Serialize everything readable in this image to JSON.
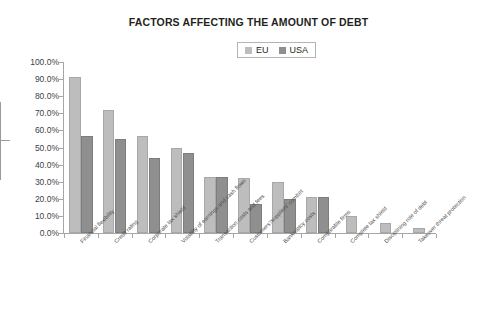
{
  "chart_data": {
    "type": "bar",
    "title": "FACTORS AFFECTING THE AMOUNT OF DEBT",
    "xlabel": "",
    "ylabel": "",
    "ylim": [
      0,
      100
    ],
    "ytick_labels": [
      "100.0%",
      "90.0%",
      "80.0%",
      "70.0%",
      "60.0%",
      "50.0%",
      "40.0%",
      "30.0%",
      "20.0%",
      "10.0%",
      "0.0%"
    ],
    "ytick_values": [
      100,
      90,
      80,
      70,
      60,
      50,
      40,
      30,
      20,
      10,
      0
    ],
    "grid": false,
    "legend_position": "top-center",
    "categories": [
      "Financial flexibility",
      "Credit rating",
      "Corporate tax shield",
      "Volatility of earnings and cash flows",
      "Transaction costs and fees",
      "Customers'/suppliers' comfort",
      "Bankruptcy costs",
      "Comparable firms",
      "Complete tax shield",
      "Disciplining role of debt",
      "Takeover threat protection"
    ],
    "series": [
      {
        "name": "EU",
        "color": "#bdbdbd",
        "values": [
          91,
          72,
          57,
          50,
          33,
          32,
          30,
          21,
          10,
          6,
          3
        ]
      },
      {
        "name": "USA",
        "color": "#8f8f8f",
        "values": [
          57,
          55,
          44,
          47,
          33,
          17,
          20,
          21,
          null,
          null,
          null
        ]
      }
    ]
  },
  "legend": {
    "items": [
      {
        "label": "EU",
        "color": "#bdbdbd"
      },
      {
        "label": "USA",
        "color": "#8f8f8f"
      }
    ]
  }
}
